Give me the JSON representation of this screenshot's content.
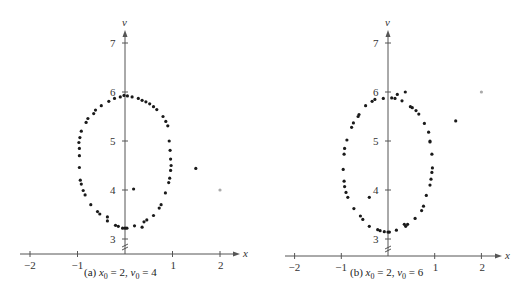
{
  "chart_data": [
    {
      "type": "scatter",
      "title": "",
      "caption": {
        "prefix": "(a) ",
        "x0_value": "2",
        "v0_value": "4"
      },
      "xlabel": "x",
      "ylabel": "v",
      "xticks": [
        -2,
        -1,
        1,
        2
      ],
      "yticks": [
        3,
        4,
        5,
        6,
        7
      ],
      "xlim": [
        -2.2,
        2.3
      ],
      "ylim": [
        2.7,
        7.4
      ],
      "y_axis_break": true,
      "grid": false,
      "initial_point": {
        "x": 2,
        "v": 4
      },
      "points": [
        [
          -0.02,
          5.93
        ],
        [
          0.05,
          5.92
        ],
        [
          0.15,
          5.9
        ],
        [
          0.28,
          5.87
        ],
        [
          0.36,
          5.83
        ],
        [
          0.44,
          5.8
        ],
        [
          0.52,
          5.76
        ],
        [
          0.6,
          5.7
        ],
        [
          0.67,
          5.64
        ],
        [
          0.8,
          5.5
        ],
        [
          0.86,
          5.4
        ],
        [
          0.9,
          5.31
        ],
        [
          -0.1,
          5.9
        ],
        [
          -0.22,
          5.87
        ],
        [
          -0.34,
          5.81
        ],
        [
          -0.5,
          5.72
        ],
        [
          -0.62,
          5.63
        ],
        [
          -0.66,
          5.56
        ],
        [
          -0.78,
          5.46
        ],
        [
          -0.82,
          5.38
        ],
        [
          -0.92,
          5.2
        ],
        [
          -0.95,
          5.07
        ],
        [
          -0.97,
          4.97
        ],
        [
          -0.96,
          4.85
        ],
        [
          -0.96,
          4.7
        ],
        [
          -0.96,
          4.46
        ],
        [
          -0.94,
          4.2
        ],
        [
          -0.92,
          4.12
        ],
        [
          -0.88,
          3.99
        ],
        [
          -0.84,
          3.9
        ],
        [
          -0.72,
          3.7
        ],
        [
          -0.58,
          3.56
        ],
        [
          -0.53,
          3.51
        ],
        [
          -0.37,
          3.45
        ],
        [
          -0.37,
          3.37
        ],
        [
          -0.2,
          3.28
        ],
        [
          -0.14,
          3.26
        ],
        [
          -0.05,
          3.22
        ],
        [
          0.0,
          3.22
        ],
        [
          0.04,
          3.22
        ],
        [
          0.2,
          3.27
        ],
        [
          0.36,
          3.24
        ],
        [
          0.4,
          3.35
        ],
        [
          0.46,
          3.39
        ],
        [
          0.6,
          3.48
        ],
        [
          0.72,
          3.63
        ],
        [
          0.76,
          3.7
        ],
        [
          0.85,
          3.94
        ],
        [
          0.92,
          4.15
        ],
        [
          0.94,
          4.24
        ],
        [
          0.96,
          4.4
        ],
        [
          0.97,
          4.5
        ],
        [
          0.96,
          4.63
        ],
        [
          0.95,
          4.81
        ],
        [
          0.93,
          5.0
        ],
        [
          0.18,
          4.02
        ],
        [
          1.49,
          4.44
        ]
      ]
    },
    {
      "type": "scatter",
      "title": "",
      "caption": {
        "prefix": "(b) ",
        "x0_value": "2",
        "v0_value": "6"
      },
      "xlabel": "x",
      "ylabel": "v",
      "xticks": [
        -2,
        -1,
        1,
        2
      ],
      "yticks": [
        3,
        4,
        5,
        6,
        7
      ],
      "xlim": [
        -2.2,
        2.3
      ],
      "ylim": [
        2.7,
        7.4
      ],
      "y_axis_break": true,
      "grid": false,
      "initial_point": {
        "x": 2,
        "v": 6
      },
      "points": [
        [
          0.08,
          5.88
        ],
        [
          0.15,
          5.87
        ],
        [
          0.2,
          5.95
        ],
        [
          0.3,
          5.82
        ],
        [
          0.37,
          6.0
        ],
        [
          0.48,
          5.7
        ],
        [
          0.52,
          5.68
        ],
        [
          0.6,
          5.62
        ],
        [
          0.66,
          5.55
        ],
        [
          0.78,
          5.36
        ],
        [
          0.87,
          5.18
        ],
        [
          0.9,
          5.0
        ],
        [
          -0.1,
          5.87
        ],
        [
          -0.28,
          5.85
        ],
        [
          -0.34,
          5.81
        ],
        [
          -0.48,
          5.72
        ],
        [
          -0.62,
          5.54
        ],
        [
          -0.64,
          5.5
        ],
        [
          -0.74,
          5.37
        ],
        [
          -0.78,
          5.28
        ],
        [
          -0.88,
          5.02
        ],
        [
          -0.93,
          4.85
        ],
        [
          -0.94,
          4.73
        ],
        [
          -0.96,
          4.42
        ],
        [
          -0.94,
          4.18
        ],
        [
          -0.93,
          4.07
        ],
        [
          -0.9,
          3.95
        ],
        [
          -0.86,
          3.85
        ],
        [
          -0.73,
          3.62
        ],
        [
          -0.59,
          3.47
        ],
        [
          -0.54,
          3.4
        ],
        [
          -0.4,
          3.26
        ],
        [
          -0.22,
          3.19
        ],
        [
          -0.17,
          3.17
        ],
        [
          -0.08,
          3.15
        ],
        [
          0.0,
          3.14
        ],
        [
          0.03,
          3.14
        ],
        [
          0.18,
          3.18
        ],
        [
          0.35,
          3.3
        ],
        [
          0.38,
          3.26
        ],
        [
          0.42,
          3.3
        ],
        [
          0.58,
          3.42
        ],
        [
          0.72,
          3.58
        ],
        [
          0.76,
          3.67
        ],
        [
          0.82,
          3.89
        ],
        [
          0.9,
          4.1
        ],
        [
          0.92,
          4.22
        ],
        [
          0.94,
          4.36
        ],
        [
          0.95,
          4.45
        ],
        [
          0.94,
          4.73
        ],
        [
          0.9,
          4.98
        ],
        [
          -0.4,
          3.85
        ],
        [
          1.45,
          5.41
        ]
      ]
    }
  ]
}
